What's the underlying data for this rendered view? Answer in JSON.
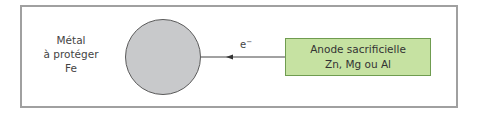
{
  "diagram": {
    "type": "sacrificial-anode-cathodic-protection",
    "protected_metal": {
      "lines": [
        "Métal",
        "à protéger",
        "Fe"
      ],
      "shape": "circle",
      "fill_color": "#c8c9cb"
    },
    "connection": {
      "label": "e",
      "label_superscript": "−",
      "direction": "from anode to protected metal (right to left)"
    },
    "anode": {
      "title": "Anode sacrificielle",
      "materials": "Zn, Mg ou Al",
      "fill_color": "#c6e2a2",
      "border_color": "#6f9c50"
    },
    "frame_color": "#a0a0a0"
  }
}
